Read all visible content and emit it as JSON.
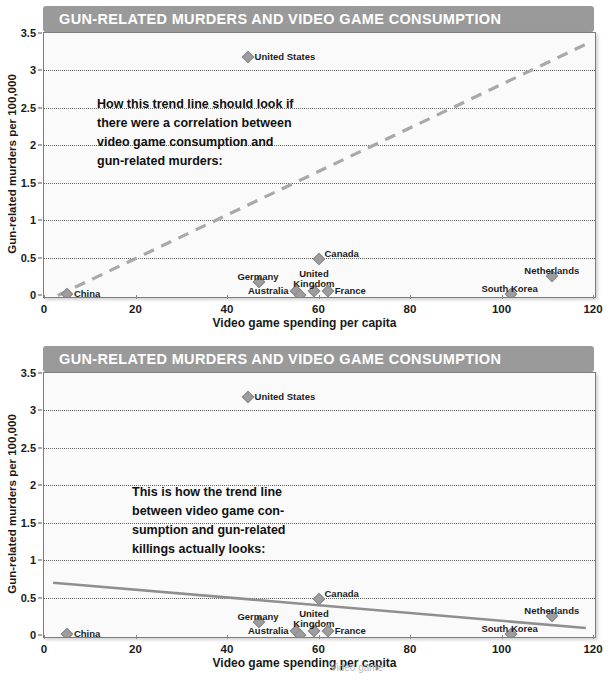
{
  "page": {
    "width": 609,
    "height": 681,
    "background": "#ffffff",
    "title_bar_color": "#9a9a9a",
    "plot_background": "#fafafa",
    "marker_color": "#9d9d9d",
    "trend_color_dashed": "#a9a9a9",
    "trend_color_solid": "#8f8f8f"
  },
  "charts": [
    {
      "id": "chart-1",
      "title": "GUN-RELATED MURDERS AND VIDEO GAME CONSUMPTION",
      "annotation": "How this trend line should look if\nthere were a correlation between\nvideo game consumption and\ngun-related murders:"
    },
    {
      "id": "chart-2",
      "title": "GUN-RELATED MURDERS AND VIDEO GAME CONSUMPTION",
      "annotation": "This is how the trend line\nbetween video game con-\nsumption and gun-related\nkillings actually looks:"
    }
  ],
  "footer_partial": "Video game",
  "chart_data": [
    {
      "type": "scatter",
      "title": "GUN-RELATED MURDERS AND VIDEO GAME CONSUMPTION",
      "xlabel": "Video game spending per capita",
      "ylabel": "Gun-related murders per 100,000",
      "xlim": [
        0,
        120
      ],
      "ylim": [
        0,
        3.5
      ],
      "xticks": [
        0,
        20,
        40,
        60,
        80,
        100,
        120
      ],
      "yticks": [
        0,
        0.5,
        1,
        1.5,
        2,
        2.5,
        3,
        3.5
      ],
      "ytick_labels": [
        "0",
        "0.5",
        "1",
        "1.5",
        "2",
        "2.5",
        "3",
        "3.5"
      ],
      "grid": "horizontal-dotted",
      "legend": "none",
      "points": [
        {
          "label": "China",
          "x": 5,
          "y": 0.02,
          "label_pos": "right"
        },
        {
          "label": "Germany",
          "x": 47,
          "y": 0.17,
          "label_pos": "above-left"
        },
        {
          "label": "Australia",
          "x": 55,
          "y": 0.05,
          "label_pos": "left"
        },
        {
          "label": "Japan",
          "x": 56,
          "y": 0.0,
          "label_pos": "below"
        },
        {
          "label": "United\nKingdom",
          "x": 59,
          "y": 0.05,
          "label_pos": "above"
        },
        {
          "label": "France",
          "x": 62,
          "y": 0.06,
          "label_pos": "right"
        },
        {
          "label": "Canada",
          "x": 60,
          "y": 0.48,
          "label_pos": "above-right"
        },
        {
          "label": "United States",
          "x": 44.5,
          "y": 3.18,
          "label_pos": "right"
        },
        {
          "label": "South Korea",
          "x": 102,
          "y": 0.02,
          "label_pos": "above-left"
        },
        {
          "label": "Netherlands",
          "x": 111,
          "y": 0.25,
          "label_pos": "above"
        }
      ],
      "trendline": {
        "style": "dashed",
        "x0": 3,
        "y0": 0.02,
        "x1": 118,
        "y1": 3.35,
        "note": "hypothetical positive correlation"
      },
      "annotation": "How this trend line should look if there were a correlation between video game consumption and gun-related murders:"
    },
    {
      "type": "scatter",
      "title": "GUN-RELATED MURDERS AND VIDEO GAME CONSUMPTION",
      "xlabel": "Video game spending per capita",
      "ylabel": "Gun-related murders per 100,000",
      "xlim": [
        0,
        120
      ],
      "ylim": [
        0,
        3.5
      ],
      "xticks": [
        0,
        20,
        40,
        60,
        80,
        100,
        120
      ],
      "yticks": [
        0,
        0.5,
        1,
        1.5,
        2,
        2.5,
        3,
        3.5
      ],
      "ytick_labels": [
        "0",
        "0.5",
        "1",
        "1.5",
        "2",
        "2.5",
        "3",
        "3.5"
      ],
      "grid": "horizontal-dotted",
      "legend": "none",
      "points": [
        {
          "label": "China",
          "x": 5,
          "y": 0.02,
          "label_pos": "right"
        },
        {
          "label": "Germany",
          "x": 47,
          "y": 0.17,
          "label_pos": "above-left"
        },
        {
          "label": "Australia",
          "x": 55,
          "y": 0.05,
          "label_pos": "left"
        },
        {
          "label": "Japan",
          "x": 56,
          "y": 0.0,
          "label_pos": "below"
        },
        {
          "label": "United\nKingdom",
          "x": 59,
          "y": 0.06,
          "label_pos": "above"
        },
        {
          "label": "France",
          "x": 62,
          "y": 0.06,
          "label_pos": "right"
        },
        {
          "label": "Canada",
          "x": 60,
          "y": 0.48,
          "label_pos": "above-right"
        },
        {
          "label": "United States",
          "x": 44.5,
          "y": 3.18,
          "label_pos": "right"
        },
        {
          "label": "South Korea",
          "x": 102,
          "y": 0.02,
          "label_pos": "above-left"
        },
        {
          "label": "Netherlands",
          "x": 111,
          "y": 0.25,
          "label_pos": "above"
        }
      ],
      "trendline": {
        "style": "solid",
        "x0": 2,
        "y0": 0.72,
        "x1": 118,
        "y1": 0.12,
        "note": "actual slight negative correlation"
      },
      "annotation": "This is how the trend line between video game consumption and gun-related killings actually looks:"
    }
  ]
}
